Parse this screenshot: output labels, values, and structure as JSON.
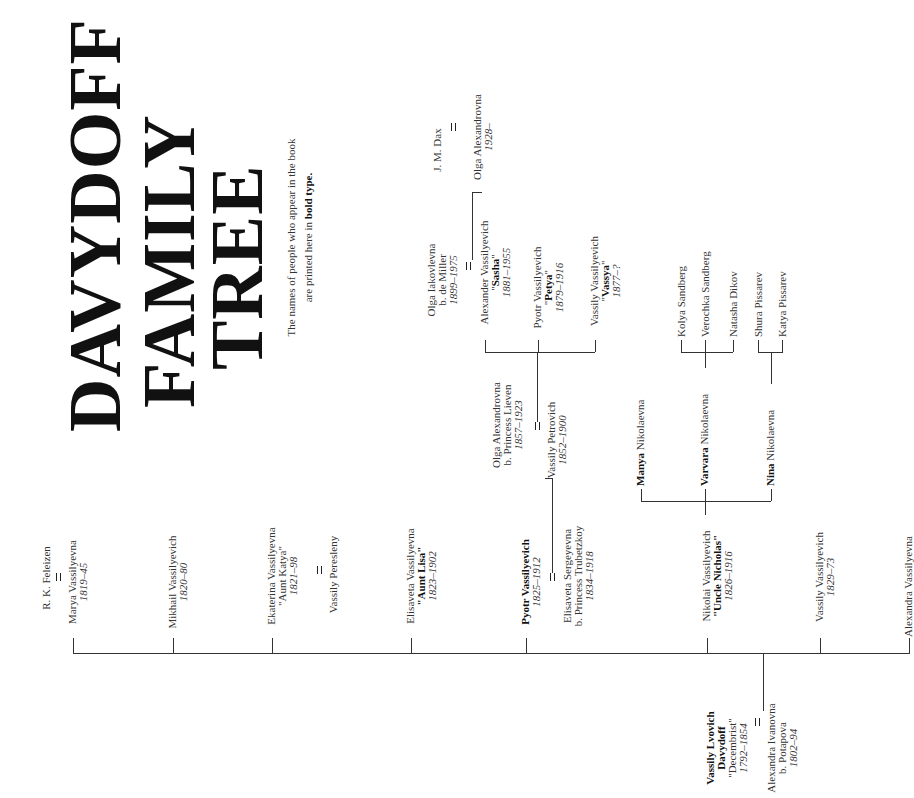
{
  "title": {
    "line1": "DAVYDOFF",
    "line2": "FAMILY",
    "line3": "TREE"
  },
  "note": {
    "line1": "The names of people who appear in the book",
    "line2_prefix": "are printed here in ",
    "line2_bold": "bold type."
  },
  "founders": {
    "husband": {
      "name1": "Vassily Lvovich",
      "name2": "Davydoff",
      "nickname": "\"Decembrist\"",
      "years": "1792–1854"
    },
    "wife": {
      "name": "Alexandra Ivanovna",
      "maiden": "b. Potapova",
      "years": "1802–94"
    }
  },
  "children": [
    {
      "name": "Marya Vassilyevna",
      "years": "1819–45",
      "spouse": "R. K. Feleizen"
    },
    {
      "name": "Mikhail Vassilyevich",
      "years": "1820–80"
    },
    {
      "name": "Ekaterina Vassilyevna",
      "nickname": "\"Aunt Katya\"",
      "years": "1821–98",
      "spouse": "Vassily Peresleny"
    },
    {
      "name": "Elisaveta Vassilyevna",
      "nickname": "\"Aunt Lisa\"",
      "years": "1823–1902"
    },
    {
      "name": "Pyotr Vassilyevich",
      "years": "1825–1912",
      "spouse": {
        "name": "Elisaveta Sergeyevna",
        "maiden": "b. Princess Trubetzkoy",
        "years": "1834–1918"
      }
    },
    {
      "name": "Nikolai Vassilyevich",
      "nickname": "\"Uncle Nicholas\"",
      "years": "1826–1916"
    },
    {
      "name": "Vassily Vassilyevich",
      "years": "1829–73"
    },
    {
      "name": "Alexandra Vassilyevna"
    }
  ],
  "pyotr_line": {
    "son": {
      "name": "Vassily Petrovich",
      "years": "1852–1900"
    },
    "son_spouse": {
      "name": "Olga Alexandrovna",
      "maiden": "b. Princess Lieven",
      "years": "1857–1923"
    },
    "grandchildren": [
      {
        "name": "Alexander Vassilyevich",
        "nickname": "Sasha",
        "years": "1881–1955",
        "spouse": {
          "name": "Olga Iakovlevna",
          "maiden": "b. de Miller",
          "years": "1899–1975"
        }
      },
      {
        "name": "Pyotr Vassilyevich",
        "nickname": "Petya",
        "years": "1879–1916"
      },
      {
        "name": "Vassily Vassilyevich",
        "nickname": "Vassya",
        "years": "1877–?"
      }
    ],
    "great_grandchild": {
      "name": "Olga Alexandrovna",
      "years": "1928–",
      "spouse": "J. M. Dax"
    }
  },
  "nikolai_line": {
    "daughters": [
      {
        "bold": "Manya",
        "rest": " Nikolaevna"
      },
      {
        "bold": "Varvara",
        "rest": " Nikolaevna"
      },
      {
        "bold": "Nina",
        "rest": " Nikolaevna"
      }
    ],
    "varvara_children": [
      "Kolya Sandberg",
      "Verochka Sandberg",
      "Natasha Dikov"
    ],
    "nina_children": [
      "Shura Pissarev",
      "Katya Pissarev"
    ]
  },
  "quote_open": "\"",
  "quote_close": "\""
}
